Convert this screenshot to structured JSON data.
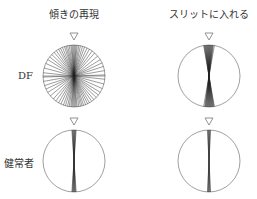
{
  "columns": [
    {
      "label": "傾きの再現",
      "center_x": 74
    },
    {
      "label": "スリットに入れる",
      "center_x": 209
    }
  ],
  "rows": [
    {
      "label": "DF",
      "center_y": 76
    },
    {
      "label": "健常者",
      "center_y": 161
    }
  ],
  "circle": {
    "radius": 31,
    "stroke": "#888888"
  },
  "marker": {
    "shape": "down-triangle",
    "stroke": "#777777"
  },
  "panels": [
    {
      "row": 0,
      "col": 0,
      "angles": [
        -88,
        -80,
        -72,
        -65,
        -58,
        -50,
        -42,
        -36,
        -30,
        -25,
        -20,
        -16,
        -12,
        -9,
        -6,
        -4,
        -2,
        0,
        2,
        4,
        6,
        9,
        12,
        15,
        18,
        22,
        26,
        30,
        35,
        40,
        46,
        52,
        58,
        66,
        75,
        84,
        90
      ]
    },
    {
      "row": 0,
      "col": 1,
      "angles": [
        -10,
        -8,
        -7,
        -6,
        -5,
        -4,
        -3,
        -2,
        -1,
        0,
        1,
        2,
        3,
        4,
        5,
        6,
        7,
        8,
        9,
        10
      ]
    },
    {
      "row": 1,
      "col": 0,
      "angles": [
        -4,
        -3,
        -2,
        -1,
        0,
        1,
        2,
        3,
        4
      ]
    },
    {
      "row": 1,
      "col": 1,
      "angles": [
        -3,
        -2,
        -1,
        0,
        1,
        2,
        3
      ]
    }
  ]
}
